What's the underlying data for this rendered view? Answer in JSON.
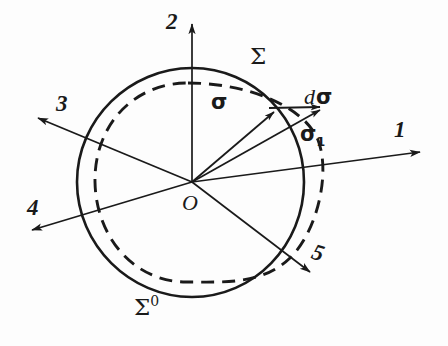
{
  "figure": {
    "background_color": "#fdfdfd",
    "ink_color": "#1a1a1a",
    "width": 448,
    "height": 346,
    "origin_label": "O",
    "curves": {
      "solid_label": "Σ",
      "solid_label_sup": "0",
      "dashed_label": "Σ"
    },
    "axes": [
      {
        "name": "axis-1",
        "label": "1",
        "direction_deg": -10
      },
      {
        "name": "axis-2",
        "label": "2",
        "direction_deg": -90
      },
      {
        "name": "axis-3",
        "label": "3",
        "direction_deg": -152
      },
      {
        "name": "axis-4",
        "label": "4",
        "direction_deg": 160
      },
      {
        "name": "axis-5",
        "label": "5",
        "direction_deg": 40
      }
    ],
    "vectors": [
      {
        "name": "sigma",
        "label": "σ",
        "sub": ""
      },
      {
        "name": "sigma-one",
        "label": "σ",
        "sub": "1"
      },
      {
        "name": "d-sigma",
        "label": "σ",
        "prefix": "d"
      }
    ]
  }
}
